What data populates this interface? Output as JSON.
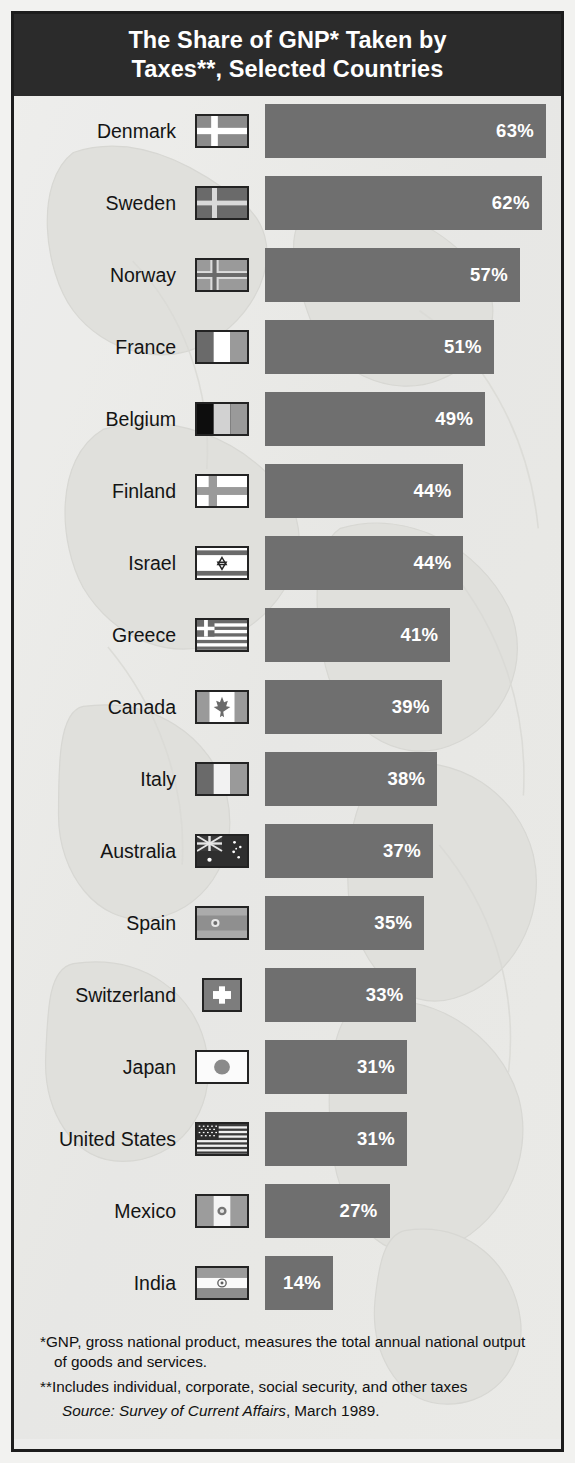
{
  "title": {
    "line1": "The Share of GNP* Taken by",
    "line2": "Taxes**, Selected Countries"
  },
  "notes": {
    "footnote1_marker": "*",
    "footnote1": "GNP, gross national product, measures the total annual national output of goods and services.",
    "footnote2": "**Includes individual, corporate, social security, and other taxes",
    "source_label": "Source",
    "source_text": ": Survey of Current Affairs, March 1989.",
    "source_italic": "Survey of Current Affairs",
    "source_prefix": "Source:",
    "source_suffix": ", March 1989."
  },
  "colors": {
    "bar": "#6f6f6f",
    "title_band": "#2b2b2b",
    "background": "#ececeb",
    "border": "#1d1d1d",
    "value_text": "#ffffff",
    "label_text": "#141414"
  },
  "chart_data": {
    "type": "bar",
    "title": "The Share of GNP* Taken by Taxes**, Selected Countries",
    "xlabel": "",
    "ylabel": "",
    "orientation": "horizontal",
    "value_suffix": "%",
    "xlim": [
      0,
      63
    ],
    "grid": false,
    "legend": false,
    "categories": [
      "Denmark",
      "Sweden",
      "Norway",
      "France",
      "Belgium",
      "Finland",
      "Israel",
      "Greece",
      "Canada",
      "Italy",
      "Australia",
      "Spain",
      "Switzerland",
      "Japan",
      "United States",
      "Mexico",
      "India"
    ],
    "values": [
      63,
      62,
      57,
      51,
      49,
      44,
      44,
      41,
      39,
      38,
      37,
      35,
      33,
      31,
      31,
      27,
      14
    ],
    "rows": [
      {
        "country": "Denmark",
        "value": 63,
        "label": "63%",
        "flag": "denmark-flag"
      },
      {
        "country": "Sweden",
        "value": 62,
        "label": "62%",
        "flag": "sweden-flag"
      },
      {
        "country": "Norway",
        "value": 57,
        "label": "57%",
        "flag": "norway-flag"
      },
      {
        "country": "France",
        "value": 51,
        "label": "51%",
        "flag": "france-flag"
      },
      {
        "country": "Belgium",
        "value": 49,
        "label": "49%",
        "flag": "belgium-flag"
      },
      {
        "country": "Finland",
        "value": 44,
        "label": "44%",
        "flag": "finland-flag"
      },
      {
        "country": "Israel",
        "value": 44,
        "label": "44%",
        "flag": "israel-flag"
      },
      {
        "country": "Greece",
        "value": 41,
        "label": "41%",
        "flag": "greece-flag"
      },
      {
        "country": "Canada",
        "value": 39,
        "label": "39%",
        "flag": "canada-flag"
      },
      {
        "country": "Italy",
        "value": 38,
        "label": "38%",
        "flag": "italy-flag"
      },
      {
        "country": "Australia",
        "value": 37,
        "label": "37%",
        "flag": "australia-flag"
      },
      {
        "country": "Spain",
        "value": 35,
        "label": "35%",
        "flag": "spain-flag"
      },
      {
        "country": "Switzerland",
        "value": 33,
        "label": "33%",
        "flag": "switzerland-flag"
      },
      {
        "country": "Japan",
        "value": 31,
        "label": "31%",
        "flag": "japan-flag"
      },
      {
        "country": "United States",
        "value": 31,
        "label": "31%",
        "flag": "united-states-flag"
      },
      {
        "country": "Mexico",
        "value": 27,
        "label": "27%",
        "flag": "mexico-flag"
      },
      {
        "country": "India",
        "value": 14,
        "label": "14%",
        "flag": "india-flag"
      }
    ]
  }
}
